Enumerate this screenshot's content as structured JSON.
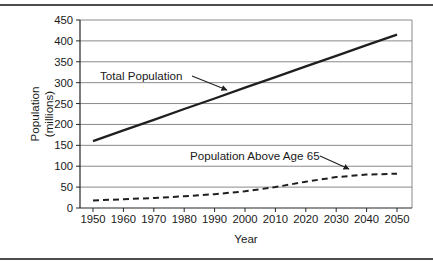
{
  "figure": {
    "background": "#ffffff",
    "has_top_rule": true,
    "has_bottom_rule": true
  },
  "chart_data": {
    "type": "line",
    "title": "",
    "xlabel": "Year",
    "ylabel": "Population (millions)",
    "ylabel_lines": [
      "Population",
      "(millions)"
    ],
    "x": [
      1950,
      1960,
      1970,
      1980,
      1990,
      2000,
      2010,
      2020,
      2030,
      2040,
      2050
    ],
    "xlim": [
      1950,
      2050
    ],
    "ylim": [
      0,
      450
    ],
    "yticks": [
      0,
      50,
      100,
      150,
      200,
      250,
      300,
      350,
      400,
      450
    ],
    "grid": "horizontal-only",
    "legend": "none-inline-arrow-annotations",
    "series": [
      {
        "name": "Total Population",
        "line_style": "solid",
        "color": "#1f1f1f",
        "values": [
          160,
          186,
          211,
          237,
          262,
          288,
          313,
          339,
          364,
          390,
          415
        ],
        "label_arrow_target": {
          "year": 1995,
          "value": 278
        }
      },
      {
        "name": "Population Above Age 65",
        "line_style": "dashed",
        "color": "#1f1f1f",
        "values": [
          18,
          21,
          24,
          28,
          33,
          40,
          50,
          63,
          74,
          80,
          82
        ],
        "label_arrow_target": {
          "year": 2035,
          "value": 79
        }
      }
    ],
    "colors": {
      "line": "#1f1f1f",
      "grid": "#8a8a8a",
      "axis": "#262626",
      "text": "#1a1a1a",
      "rule": "#4d4d4d",
      "background": "#ffffff"
    }
  }
}
